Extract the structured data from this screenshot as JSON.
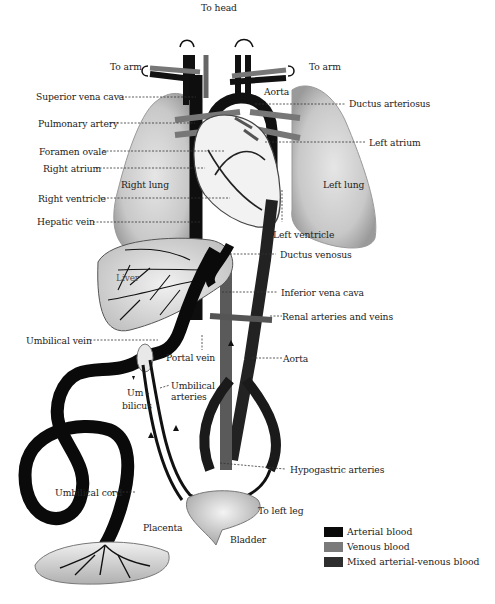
{
  "diagram": {
    "labels": {
      "to_head": "To head",
      "to_arm_left": "To arm",
      "to_arm_right": "To arm",
      "superior_vena_cava": "Superior vena cava",
      "aorta_top": "Aorta",
      "ductus_arteriosus": "Ductus arteriosus",
      "pulmonary_artery": "Pulmonary artery",
      "left_atrium": "Left atrium",
      "foramen_ovale": "Foramen ovale",
      "right_atrium": "Right atrium",
      "right_lung": "Right lung",
      "left_lung": "Left lung",
      "right_ventricle": "Right ventricle",
      "hepatic_vein": "Hepatic vein",
      "left_ventricle": "Left ventricle",
      "ductus_venosus": "Ductus venosus",
      "liver": "Liver",
      "inferior_vena_cava": "Inferior vena cava",
      "renal_arteries_veins": "Renal arteries and veins",
      "umbilical_vein": "Umbilical vein",
      "portal_vein": "Portal vein",
      "aorta_bottom": "Aorta",
      "umbilical_arteries_1": "Umbilical",
      "umbilical_arteries_2": "arteries",
      "umbilicus_1": "Um -",
      "umbilicus_2": "bilicus",
      "hypogastric_arteries": "Hypogastric arteries",
      "umbilical_cord": "Umbilical cord",
      "to_left_leg": "To left leg",
      "placenta": "Placenta",
      "bladder": "Bladder"
    },
    "legend": [
      {
        "label": "Arterial blood",
        "color": "#0a0a0a"
      },
      {
        "label": "Venous blood",
        "color": "#7a7a7a"
      },
      {
        "label": "Mixed arterial-venous blood",
        "color": "#2e2e2e"
      }
    ]
  }
}
